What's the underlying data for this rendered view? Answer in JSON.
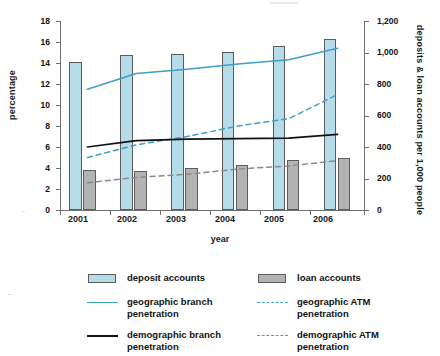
{
  "chart_data": {
    "type": "bar",
    "title": "",
    "xlabel": "year",
    "ylabel": "percentage",
    "y2label": "deposits & loan accounts per 1,000 people",
    "categories": [
      "2001",
      "2002",
      "2003",
      "2004",
      "2005",
      "2006"
    ],
    "ylim": [
      0,
      18
    ],
    "y2lim": [
      0,
      1200
    ],
    "yticks": [
      "0",
      "2",
      "4",
      "6",
      "8",
      "10",
      "12",
      "14",
      "16",
      "18"
    ],
    "y2ticks": [
      "0",
      "200",
      "400",
      "600",
      "800",
      "1,000",
      "1,200"
    ],
    "grid": false,
    "legend_position": "bottom",
    "bar_series": [
      {
        "name": "deposit accounts",
        "axis": "right",
        "units": "accounts per 1,000 people",
        "color": "#b6dcec",
        "values": [
          940,
          982,
          988,
          1005,
          1042,
          1088
        ],
        "percent_scale_equivalent": [
          14.1,
          14.7,
          14.8,
          15.1,
          15.6,
          16.3
        ]
      },
      {
        "name": "loan accounts",
        "axis": "right",
        "units": "accounts per 1,000 people",
        "color": "#b3b3b3",
        "values": [
          253,
          248,
          264,
          283,
          315,
          333
        ],
        "percent_scale_equivalent": [
          3.8,
          3.7,
          4.0,
          4.25,
          4.7,
          5.0
        ]
      }
    ],
    "line_series": [
      {
        "name": "geographic branch penetration",
        "axis": "left",
        "units": "percentage",
        "color": "#3d9fc4",
        "style": "solid",
        "values": [
          11.5,
          13.0,
          13.4,
          13.9,
          14.3,
          15.4
        ]
      },
      {
        "name": "geographic ATM penetration",
        "axis": "left",
        "units": "percentage",
        "color": "#3d9fc4",
        "style": "dashed",
        "values": [
          5.0,
          6.2,
          7.0,
          8.0,
          8.7,
          11.0
        ]
      },
      {
        "name": "demographic branch penetration",
        "axis": "left",
        "units": "percentage",
        "color": "#111111",
        "style": "solid",
        "values": [
          6.0,
          6.6,
          6.75,
          6.8,
          6.85,
          7.2
        ]
      },
      {
        "name": "demographic ATM penetration",
        "axis": "left",
        "units": "percentage",
        "color": "#8a8a8a",
        "style": "dashed",
        "values": [
          2.6,
          3.1,
          3.4,
          3.9,
          4.2,
          4.7
        ]
      }
    ]
  },
  "axes": {
    "left": {
      "title": "percentage",
      "ticks": [
        "18",
        "16",
        "14",
        "12",
        "10",
        "8",
        "6",
        "4",
        "2",
        "0"
      ]
    },
    "right": {
      "title": "deposits & loan accounts per 1,000 people",
      "ticks": [
        "1,200",
        "1,000",
        "800",
        "600",
        "400",
        "200",
        "0"
      ]
    },
    "bottom": {
      "title": "year",
      "ticks": [
        "2001",
        "2002",
        "2003",
        "2004",
        "2005",
        "2006"
      ]
    }
  },
  "legend": {
    "items": [
      {
        "label": "deposit accounts",
        "key": "swatch-deposit",
        "color": "#b6dcec"
      },
      {
        "label": "loan accounts",
        "key": "swatch-loan",
        "color": "#b3b3b3"
      },
      {
        "label": "geographic branch penetration",
        "key": "line-solid-blue",
        "color": "#3d9fc4"
      },
      {
        "label": "geographic ATM penetration",
        "key": "line-dash-blue",
        "color": "#3d9fc4"
      },
      {
        "label": "demographic branch penetration",
        "key": "line-solid-black",
        "color": "#111111"
      },
      {
        "label": "demographic ATM penetration",
        "key": "line-dash-gray",
        "color": "#8a8a8a"
      }
    ]
  },
  "colors": {
    "deposit_bar": "#b6dcec",
    "loan_bar": "#b3b3b3",
    "blue_series": "#3d9fc4",
    "black_series": "#111111",
    "gray_series": "#8a8a8a",
    "axis": "#6f6f6f",
    "background": "#ffffff"
  }
}
